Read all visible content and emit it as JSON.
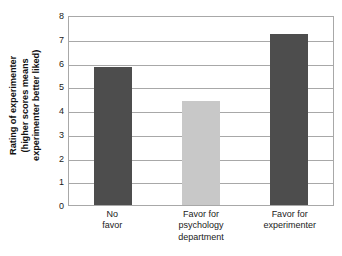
{
  "chart_data": {
    "type": "bar",
    "title": "",
    "xlabel": "",
    "ylabel": "Rating of experimenter (higher scores means experimenter better liked)",
    "ylabel_lines": [
      "Rating of experimenter",
      "(higher scores means",
      "experimenter better liked)"
    ],
    "categories": [
      "No favor",
      "Favor for psychology department",
      "Favor for experimenter"
    ],
    "category_lines": [
      [
        "No",
        "favor"
      ],
      [
        "Favor for",
        "psychology",
        "department"
      ],
      [
        "Favor for",
        "experimenter"
      ]
    ],
    "values": [
      5.8,
      4.4,
      7.2
    ],
    "bar_colors": [
      "#4d4d4d",
      "#c8c8c8",
      "#4d4d4d"
    ],
    "ylim": [
      0,
      8
    ],
    "yticks": [
      0,
      1,
      2,
      3,
      4,
      5,
      6,
      7,
      8
    ],
    "ytick_labels": [
      "0",
      "1",
      "2",
      "3",
      "4",
      "5",
      "6",
      "7",
      "8"
    ],
    "grid": true,
    "grid_color": "#a8a8a8",
    "legend": null,
    "background": "#ffffff"
  }
}
